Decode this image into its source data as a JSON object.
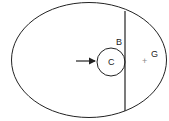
{
  "diagram": {
    "labels": {
      "B": "B",
      "C": "C",
      "G": "G",
      "plus": "+"
    },
    "stroke_color": "#222222",
    "background": "#ffffff"
  }
}
